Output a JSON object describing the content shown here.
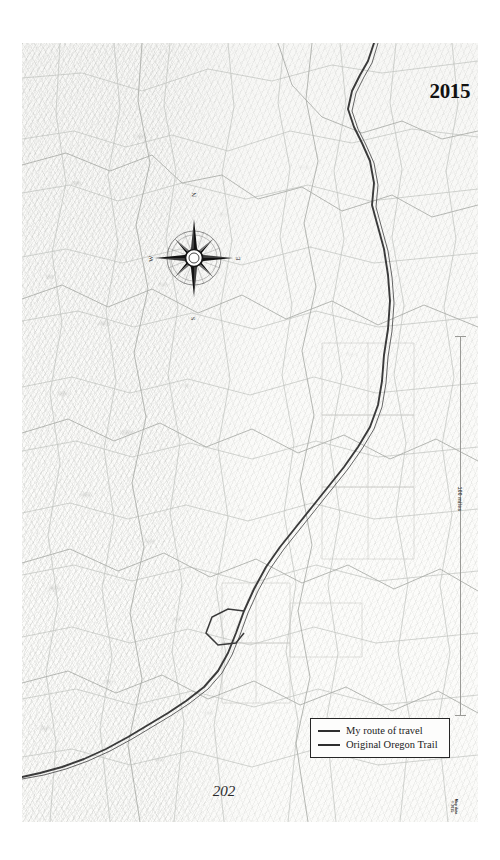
{
  "page": {
    "folio": "202",
    "year": "2015"
  },
  "map": {
    "title_year": "2015",
    "scale": {
      "label": "100 miles",
      "orientation": "vertical"
    },
    "compass": {
      "name": "compass-rose",
      "points": 8,
      "north_label": "N",
      "east_label": "E",
      "south_label": "S",
      "west_label": "W"
    },
    "legend": {
      "entries": [
        {
          "label": "My route of travel",
          "style": "thin",
          "color": "#2e2e2e"
        },
        {
          "label": "Original Oregon Trail",
          "style": "thick",
          "color": "#2e2e2e"
        }
      ]
    },
    "credit": "Map data\n© 2015",
    "colors": {
      "route": "#2e2e2e",
      "roads": "#b4b6b2",
      "terrain": "#f8f8f6",
      "border": "#262626",
      "paper": "#ffffff"
    }
  }
}
